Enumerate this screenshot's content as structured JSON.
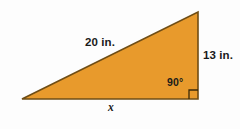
{
  "figure": {
    "background_color": "#fdfdfd",
    "shape": {
      "name": "right triangle",
      "fill_color": "#e89a2c",
      "stroke_color": "#6b4a14",
      "vertices": {
        "left": [
          22,
          99
        ],
        "top_right": [
          198,
          12
        ],
        "bottom_right": [
          198,
          99
        ]
      }
    },
    "labels": {
      "hypotenuse": "20 in.",
      "right_leg": "13 in.",
      "angle": "90°",
      "base": "x"
    },
    "right_angle_marker": {
      "name": "right-angle-square",
      "size": 9,
      "stroke_color": "#3b2a08"
    }
  }
}
